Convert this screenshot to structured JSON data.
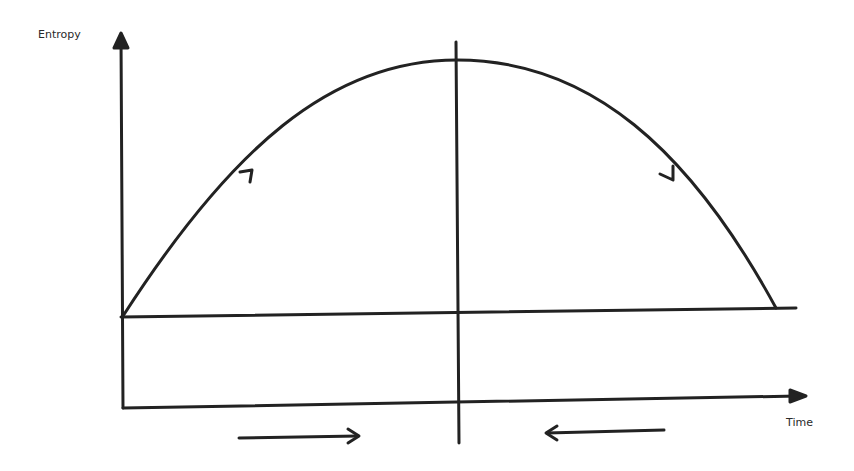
{
  "diagram": {
    "y_axis_label": "Entropy",
    "x_axis_label": "Time",
    "stroke_color": "#222222",
    "background": "#ffffff",
    "elements": [
      {
        "name": "y-axis",
        "description": "vertical axis with upward arrow"
      },
      {
        "name": "x-axis",
        "description": "horizontal time axis with rightward arrow"
      },
      {
        "name": "baseline",
        "description": "horizontal reference line at initial entropy"
      },
      {
        "name": "entropy-curve",
        "description": "parabolic arch rising from baseline to peak and falling back"
      },
      {
        "name": "center-divider",
        "description": "vertical line through the peak"
      },
      {
        "name": "rising-arrow",
        "description": "arrowhead on rising half of curve"
      },
      {
        "name": "falling-arrow",
        "description": "arrowhead on falling half of curve"
      },
      {
        "name": "time-forward-arrow",
        "description": "right-pointing arrow below axis, left half"
      },
      {
        "name": "time-backward-arrow",
        "description": "left-pointing arrow below axis, right half"
      }
    ]
  }
}
